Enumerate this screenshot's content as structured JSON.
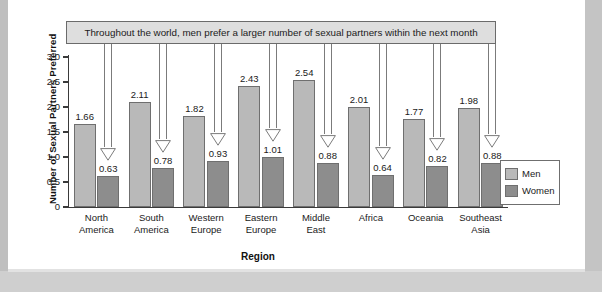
{
  "chart_data": {
    "type": "bar",
    "title": "",
    "annotation": "Throughout the world, men prefer a larger number of sexual partners within the next month",
    "xlabel": "Region",
    "ylabel": "Number of Sexual Partners Preferred",
    "ylim": [
      0,
      3.0
    ],
    "yticks": [
      "3.0",
      "2.5",
      "2.0",
      "1.5",
      "1.0",
      "0.5",
      "0"
    ],
    "ytick_values": [
      3.0,
      2.5,
      2.0,
      1.5,
      1.0,
      0.5,
      0
    ],
    "grid": false,
    "legend_position": "right",
    "categories": [
      "North\nAmerica",
      "South\nAmerica",
      "Western\nEurope",
      "Eastern\nEurope",
      "Middle\nEast",
      "Africa",
      "Oceania",
      "Southeast\nAsia"
    ],
    "series": [
      {
        "name": "Men",
        "color": "#b9b9b9",
        "values": [
          1.66,
          2.11,
          1.82,
          2.43,
          2.54,
          2.01,
          1.77,
          1.98
        ],
        "labels": [
          "1.66",
          "2.11",
          "1.82",
          "2.43",
          "2.54",
          "2.01",
          "1.77",
          "1.98"
        ]
      },
      {
        "name": "Women",
        "color": "#8d8d8d",
        "values": [
          0.63,
          0.78,
          0.93,
          1.01,
          0.88,
          0.64,
          0.82,
          0.88
        ],
        "labels": [
          "0.63",
          "0.78",
          "0.93",
          "1.01",
          "0.88",
          "0.64",
          "0.82",
          "0.88"
        ]
      }
    ]
  },
  "legend": {
    "items": [
      {
        "label": "Men",
        "color": "#b9b9b9"
      },
      {
        "label": "Women",
        "color": "#8d8d8d"
      }
    ]
  }
}
